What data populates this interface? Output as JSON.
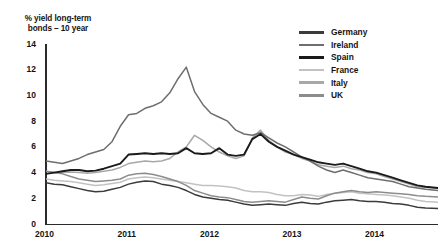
{
  "chart_data": {
    "type": "line",
    "title": "% yield long-term bonds – 10 year",
    "ylabel": "% yield long-term bonds – 10 year",
    "xlabel": "",
    "ylim": [
      0,
      14
    ],
    "yticks": [
      0,
      2,
      4,
      6,
      8,
      10,
      12,
      14
    ],
    "xticks": [
      "2010",
      "2011",
      "2012",
      "2013",
      "2014"
    ],
    "xlim": [
      2010.0,
      2014.75
    ],
    "grid": false,
    "legend_position": "top-right",
    "x": [
      2010.0,
      2010.1,
      2010.2,
      2010.3,
      2010.4,
      2010.5,
      2010.6,
      2010.7,
      2010.8,
      2010.9,
      2011.0,
      2011.1,
      2011.2,
      2011.3,
      2011.4,
      2011.5,
      2011.6,
      2011.7,
      2011.8,
      2011.9,
      2012.0,
      2012.1,
      2012.2,
      2012.3,
      2012.4,
      2012.5,
      2012.6,
      2012.7,
      2012.8,
      2012.9,
      2013.0,
      2013.1,
      2013.2,
      2013.3,
      2013.4,
      2013.5,
      2013.6,
      2013.7,
      2013.8,
      2013.9,
      2014.0,
      2014.1,
      2014.2,
      2014.3,
      2014.4,
      2014.5,
      2014.6,
      2014.75
    ],
    "series": [
      {
        "name": "Germany",
        "color": "#3b3b3b",
        "values": [
          3.2,
          3.1,
          3.05,
          2.9,
          2.75,
          2.6,
          2.5,
          2.55,
          2.7,
          2.85,
          3.1,
          3.25,
          3.35,
          3.3,
          3.1,
          3.0,
          2.85,
          2.6,
          2.3,
          2.1,
          2.0,
          1.9,
          1.85,
          1.7,
          1.55,
          1.45,
          1.5,
          1.55,
          1.5,
          1.45,
          1.6,
          1.7,
          1.6,
          1.55,
          1.7,
          1.8,
          1.85,
          1.9,
          1.8,
          1.75,
          1.75,
          1.7,
          1.6,
          1.55,
          1.45,
          1.3,
          1.25,
          1.2
        ]
      },
      {
        "name": "Ireland",
        "color": "#6e6e6e",
        "values": [
          4.9,
          4.8,
          4.7,
          4.9,
          5.1,
          5.4,
          5.6,
          5.8,
          6.4,
          7.6,
          8.5,
          8.6,
          9.0,
          9.2,
          9.5,
          10.2,
          11.3,
          12.2,
          10.3,
          9.3,
          8.6,
          8.3,
          8.0,
          7.3,
          7.0,
          6.9,
          7.1,
          6.7,
          6.3,
          6.0,
          5.6,
          5.2,
          4.9,
          4.5,
          4.2,
          4.0,
          4.2,
          4.0,
          3.8,
          3.6,
          3.5,
          3.4,
          3.3,
          3.1,
          2.9,
          2.8,
          2.7,
          2.6
        ]
      },
      {
        "name": "Spain",
        "color": "#1a1a1a",
        "values": [
          3.9,
          4.0,
          4.1,
          4.2,
          4.2,
          4.1,
          4.15,
          4.3,
          4.5,
          4.7,
          5.4,
          5.45,
          5.5,
          5.45,
          5.5,
          5.45,
          5.5,
          5.9,
          5.5,
          5.45,
          5.5,
          5.9,
          5.4,
          5.3,
          5.4,
          6.6,
          7.0,
          6.4,
          6.0,
          5.7,
          5.4,
          5.2,
          5.0,
          4.8,
          4.7,
          4.6,
          4.7,
          4.5,
          4.3,
          4.1,
          4.0,
          3.8,
          3.6,
          3.4,
          3.2,
          3.0,
          2.9,
          2.8
        ]
      },
      {
        "name": "France",
        "color": "#c2c2c2",
        "values": [
          3.5,
          3.4,
          3.35,
          3.3,
          3.2,
          3.1,
          3.0,
          3.05,
          3.15,
          3.25,
          3.5,
          3.6,
          3.65,
          3.6,
          3.5,
          3.4,
          3.3,
          3.2,
          3.1,
          3.0,
          3.0,
          2.95,
          2.9,
          2.8,
          2.6,
          2.5,
          2.5,
          2.45,
          2.3,
          2.2,
          2.2,
          2.3,
          2.25,
          2.15,
          2.3,
          2.4,
          2.45,
          2.5,
          2.4,
          2.35,
          2.3,
          2.25,
          2.2,
          2.1,
          2.0,
          1.85,
          1.75,
          1.7
        ]
      },
      {
        "name": "Italy",
        "color": "#a8a8a8",
        "values": [
          4.1,
          4.0,
          4.0,
          4.05,
          4.0,
          3.95,
          4.0,
          4.1,
          4.2,
          4.4,
          4.7,
          4.8,
          4.9,
          4.85,
          4.9,
          5.1,
          5.6,
          6.0,
          6.9,
          6.5,
          6.0,
          5.6,
          5.3,
          5.1,
          5.3,
          6.7,
          7.3,
          6.5,
          6.0,
          5.6,
          5.4,
          5.1,
          4.9,
          4.6,
          4.5,
          4.4,
          4.5,
          4.3,
          4.2,
          4.0,
          3.9,
          3.7,
          3.5,
          3.3,
          3.1,
          2.9,
          2.85,
          2.8
        ]
      },
      {
        "name": "UK",
        "color": "#8c8c8c",
        "values": [
          4.1,
          4.0,
          3.9,
          3.7,
          3.5,
          3.4,
          3.3,
          3.35,
          3.4,
          3.5,
          3.8,
          3.9,
          3.95,
          3.85,
          3.7,
          3.5,
          3.3,
          3.0,
          2.6,
          2.4,
          2.2,
          2.1,
          2.05,
          1.9,
          1.75,
          1.7,
          1.75,
          1.8,
          1.75,
          1.7,
          1.9,
          2.1,
          2.0,
          1.95,
          2.2,
          2.4,
          2.5,
          2.6,
          2.5,
          2.45,
          2.5,
          2.45,
          2.4,
          2.35,
          2.3,
          2.2,
          2.15,
          2.1
        ]
      }
    ]
  }
}
